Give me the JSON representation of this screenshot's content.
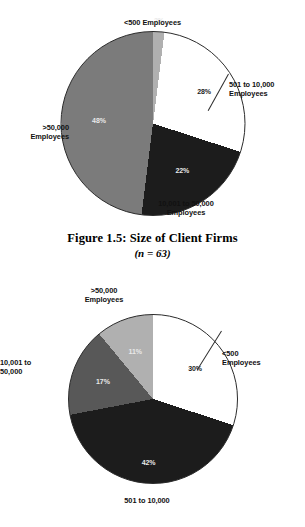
{
  "caption": {
    "title": "Figure 1.5: Size of Client Firms",
    "sample": "(n = 63)"
  },
  "colors": {
    "white": "#ffffff",
    "light_gray": "#b0b0b0",
    "medium_gray": "#7b7b7b",
    "dark_gray": "#585858",
    "black": "#1c1c1c",
    "outline": "#2b2b2b"
  },
  "chart_data": [
    {
      "type": "pie",
      "title": "Figure 1.5: Size of Client Firms",
      "subtitle": "(n = 63)",
      "n": 63,
      "start_angle": 0,
      "direction": "clockwise",
      "legend": "labels-outside-with-leaders",
      "categories": [
        "<500 Employees",
        "501 to 10,000 Employees",
        "10,001 to 50,000 Employees",
        ">50,000 Employees"
      ],
      "values": [
        2,
        28,
        22,
        48
      ],
      "value_labels": [
        "2%",
        "28%",
        "22%",
        "48%"
      ],
      "slice_colors": [
        "#b0b0b0",
        "#ffffff",
        "#1c1c1c",
        "#7b7b7b"
      ],
      "slices": [
        {
          "label": "<500 Employees",
          "label_lines": "<500 Employees",
          "value": 2,
          "value_label": "2%",
          "color": "#b0b0b0",
          "text_on": "dark"
        },
        {
          "label": "501 to 10,000 Employees",
          "label_lines": "501 to 10,000\nEmployees",
          "value": 28,
          "value_label": "28%",
          "color": "#ffffff",
          "text_on": "light"
        },
        {
          "label": "10,001 to 50,000 Employees",
          "label_lines": "10,001 to 50,000\nEmployees",
          "value": 22,
          "value_label": "22%",
          "color": "#1c1c1c",
          "text_on": "dark"
        },
        {
          "label": ">50,000 Employees",
          "label_lines": ">50,000\nEmployees",
          "value": 48,
          "value_label": "48%",
          "color": "#7b7b7b",
          "text_on": "dark"
        }
      ]
    },
    {
      "type": "pie",
      "title": "",
      "start_angle": 0,
      "direction": "clockwise",
      "legend": "labels-outside-with-leaders",
      "categories": [
        "<500 Employees",
        "501 to 10,000",
        "10,001 to 50,000",
        ">50,000 Employees"
      ],
      "values": [
        30,
        42,
        17,
        11
      ],
      "value_labels": [
        "30%",
        "42%",
        "17%",
        "11%"
      ],
      "slice_colors": [
        "#ffffff",
        "#1c1c1c",
        "#585858",
        "#b0b0b0"
      ],
      "slices": [
        {
          "label": "<500 Employees",
          "label_lines": "<500\nEmployees",
          "value": 30,
          "value_label": "30%",
          "color": "#ffffff",
          "text_on": "light"
        },
        {
          "label": "501 to 10,000",
          "label_lines": "501 to 10,000",
          "value": 42,
          "value_label": "42%",
          "color": "#1c1c1c",
          "text_on": "dark"
        },
        {
          "label": "10,001 to 50,000",
          "label_lines": "10,001 to\n50,000",
          "value": 17,
          "value_label": "17%",
          "color": "#585858",
          "text_on": "dark"
        },
        {
          "label": ">50,000 Employees",
          "label_lines": ">50,000\nEmployees",
          "value": 11,
          "value_label": "11%",
          "color": "#b0b0b0",
          "text_on": "dark"
        }
      ]
    }
  ]
}
